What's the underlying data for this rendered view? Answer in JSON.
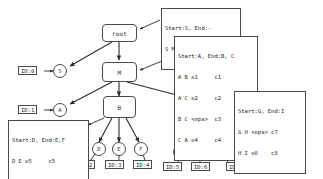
{
  "diagram": {
    "type": "grammar-parse-tree",
    "root": {
      "label": "root"
    },
    "nodes": [
      {
        "id": "root",
        "label": "root",
        "shape": "rounded-box"
      },
      {
        "id": "M",
        "label": "M",
        "shape": "rounded-box"
      },
      {
        "id": "B",
        "label": "B",
        "shape": "rounded-box"
      },
      {
        "id": "C",
        "label": "C",
        "shape": "rounded-box"
      }
    ],
    "leaves": [
      {
        "id": "S",
        "label": "S",
        "id_label": "ID:0"
      },
      {
        "id": "A",
        "label": "A",
        "id_label": "ID:1"
      },
      {
        "id": "D",
        "label": "D",
        "id_label": "ID:2"
      },
      {
        "id": "E",
        "label": "E",
        "id_label": "ID:3"
      },
      {
        "id": "F",
        "label": "F",
        "id_label": "ID:4"
      },
      {
        "id": "G",
        "label": "G",
        "id_label": "ID:5"
      },
      {
        "id": "H",
        "label": "H",
        "id_label": "ID:6"
      },
      {
        "id": "I",
        "label": "I",
        "id_label": "ID:7"
      }
    ],
    "callouts": [
      {
        "for": "root",
        "lines": [
          "Start:S, End:-",
          "S M <eps> <eps>"
        ]
      },
      {
        "for": "M",
        "lines": [
          "Start:A, End:B, C",
          "A B e1     c1",
          "A C e2     c2",
          "B C <eps>  c3",
          "C A e4     c4"
        ]
      },
      {
        "for": "B",
        "lines": [
          "Start:D, End:E,F",
          "D E e5     c5",
          "D F e6     c6"
        ]
      },
      {
        "for": "C",
        "lines": [
          "Start:G, End:I",
          "G H <eps> c7",
          "H I e8    c8"
        ]
      }
    ],
    "colors": {
      "stroke": "#4a4a4a",
      "text": "#222222",
      "background": "#ffffff"
    }
  }
}
